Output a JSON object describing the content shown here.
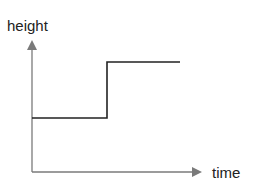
{
  "diagram": {
    "y_axis_label": "height",
    "x_axis_label": "time",
    "axis_color": "#7a7a7a",
    "line_color": "#222222",
    "step_line": {
      "description": "step function: low level then rises to high level",
      "points": [
        [
          32,
          118
        ],
        [
          107,
          118
        ],
        [
          107,
          62
        ],
        [
          180,
          62
        ]
      ]
    }
  }
}
